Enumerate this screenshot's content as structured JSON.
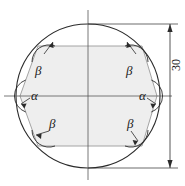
{
  "figure": {
    "shape_outer": "circle",
    "shape_inner": "hexagon",
    "colors": {
      "outline": "#2b2b2b",
      "inner_fill": "#eeeeee",
      "inner_stroke": "#9a9a9a",
      "centerline": "#555555",
      "dimension": "#2b2b2b",
      "text": "#1a1a1a",
      "background": "#ffffff"
    },
    "geometry": {
      "circle_center_x": 88,
      "circle_center_y": 96,
      "circle_radius": 72,
      "hex_top_y": 46,
      "hex_bottom_y": 146,
      "hex_left_x": 20,
      "hex_right_x": 157,
      "hex_top_left_x": 38,
      "hex_top_right_x": 142,
      "hex_bottom_left_x": 38,
      "hex_bottom_right_x": 142
    }
  },
  "labels": {
    "alpha_left": "α",
    "alpha_right": "α",
    "beta_top_left": "β",
    "beta_top_right": "β",
    "beta_bottom_left": "β",
    "beta_bottom_right": "β"
  },
  "dimension": {
    "value": "30",
    "orientation": "vertical",
    "side": "right",
    "arrow_top_y": 24,
    "arrow_bottom_y": 168,
    "line_x": 170
  }
}
